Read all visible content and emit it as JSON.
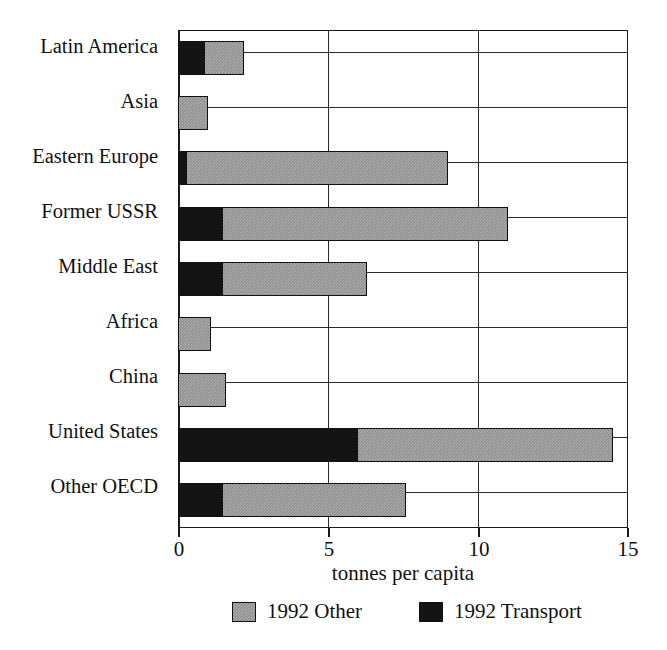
{
  "chart_data": {
    "type": "bar",
    "orientation": "horizontal",
    "stacked": true,
    "title": "",
    "xlabel": "tonnes per capita",
    "ylabel": "",
    "xlim": [
      0,
      15
    ],
    "xticks": [
      0,
      5,
      10,
      15
    ],
    "xtick_labels": [
      "0",
      "5",
      "10",
      "15"
    ],
    "grid": true,
    "grid_axis": "both",
    "legend_position": "bottom",
    "categories": [
      "Latin America",
      "Asia",
      "Eastern Europe",
      "Former USSR",
      "Middle East",
      "Africa",
      "China",
      "United States",
      "Other OECD"
    ],
    "series": [
      {
        "name": "1992 Transport",
        "color": "#141414",
        "values": [
          0.9,
          0.0,
          0.3,
          1.5,
          1.5,
          0.0,
          0.0,
          6.0,
          1.5
        ]
      },
      {
        "name": "1992 Other",
        "color": "#8d8d8d",
        "values": [
          1.3,
          1.0,
          8.7,
          9.5,
          4.8,
          1.1,
          1.6,
          8.5,
          6.1
        ]
      }
    ],
    "totals": [
      2.2,
      1.0,
      9.0,
      11.0,
      6.3,
      1.1,
      1.6,
      14.5,
      7.6
    ]
  },
  "legend": {
    "items": [
      {
        "label": "1992 Other",
        "swatch": "other"
      },
      {
        "label": "1992 Transport",
        "swatch": "transport"
      }
    ]
  }
}
